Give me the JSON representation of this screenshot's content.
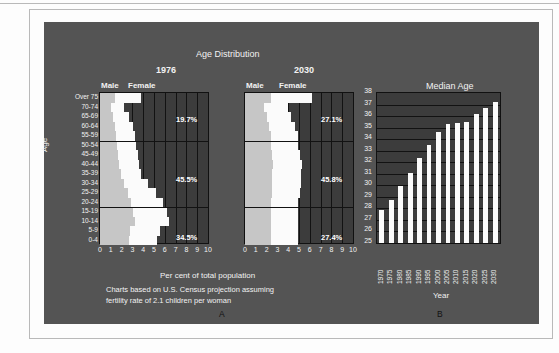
{
  "figure": {
    "panel_bg": "#545454",
    "plot_bg": "#3c3c3c",
    "male_color": "#c6c6c6",
    "female_color": "#fbfbfb",
    "grid_color": "#121212",
    "text_color": "#f2f2f2"
  },
  "chart_data": [
    {
      "type": "bar",
      "id": "A",
      "title": "Age Distribution",
      "panel_label": "A",
      "xlabel": "Per cent of total population",
      "ylabel": "Age",
      "xlim": [
        0,
        10
      ],
      "ylim": [
        0,
        16
      ],
      "grid": true,
      "legend_position": "top",
      "note_line1": "Charts based on U.S. Census projection assuming",
      "note_line2": "fertility rate of 2.1 children per woman",
      "xticks": [
        "0",
        "1",
        "2",
        "3",
        "4",
        "5",
        "6",
        "7",
        "8",
        "9",
        "10"
      ],
      "categories": [
        "Over 75",
        "70-74",
        "65-69",
        "60-64",
        "55-59",
        "50-54",
        "45-49",
        "40-44",
        "35-39",
        "30-34",
        "25-29",
        "20-24",
        "15-19",
        "10-14",
        "5-9",
        "0-4"
      ],
      "subcharts": [
        {
          "name": "1976",
          "legend": [
            "Male",
            "Female"
          ],
          "series": [
            {
              "name": "Male",
              "values": [
                1.4,
                1.0,
                1.2,
                1.4,
                1.5,
                1.6,
                1.7,
                1.8,
                1.9,
                2.2,
                2.6,
                2.9,
                3.1,
                3.2,
                2.8,
                2.7
              ]
            },
            {
              "name": "Female",
              "values": [
                2.4,
                1.2,
                1.5,
                1.7,
                1.7,
                1.7,
                1.8,
                1.8,
                1.9,
                2.2,
                2.6,
                2.9,
                3.1,
                3.2,
                2.8,
                2.6
              ]
            }
          ],
          "annotations": [
            {
              "text": "19.7%",
              "group": "55 and over"
            },
            {
              "text": "45.5%",
              "group": "20-54"
            },
            {
              "text": "34.5%",
              "group": "under 20"
            }
          ]
        },
        {
          "name": "2030",
          "legend": [
            "Male",
            "Female"
          ],
          "series": [
            {
              "name": "Male",
              "values": [
                2.4,
                1.8,
                2.0,
                2.2,
                2.4,
                2.4,
                2.5,
                2.6,
                2.5,
                2.5,
                2.5,
                2.4,
                2.4,
                2.4,
                2.4,
                2.4
              ]
            },
            {
              "name": "Female",
              "values": [
                3.8,
                2.2,
                2.3,
                2.4,
                2.5,
                2.5,
                2.6,
                2.7,
                2.7,
                2.7,
                2.6,
                2.5,
                2.5,
                2.5,
                2.5,
                2.5
              ]
            }
          ],
          "annotations": [
            {
              "text": "27.1%",
              "group": "55 and over"
            },
            {
              "text": "45.8%",
              "group": "20-54"
            },
            {
              "text": "27.4%",
              "group": "under 20"
            }
          ]
        }
      ]
    },
    {
      "type": "bar",
      "id": "B",
      "title": "Median Age",
      "panel_label": "B",
      "xlabel": "Year",
      "ylabel": "",
      "ylim": [
        25,
        38
      ],
      "grid": true,
      "yticks": [
        "25",
        "26",
        "27",
        "28",
        "29",
        "30",
        "31",
        "32",
        "33",
        "34",
        "35",
        "36",
        "37",
        "38"
      ],
      "categories": [
        "1970",
        "1975",
        "1980",
        "1985",
        "1990",
        "1995",
        "2000",
        "2005",
        "2010",
        "2015",
        "2020",
        "2025",
        "2030"
      ],
      "values": [
        27.9,
        28.7,
        29.9,
        31.1,
        32.4,
        33.5,
        34.6,
        35.3,
        35.4,
        35.5,
        36.2,
        36.7,
        37.2
      ]
    }
  ]
}
